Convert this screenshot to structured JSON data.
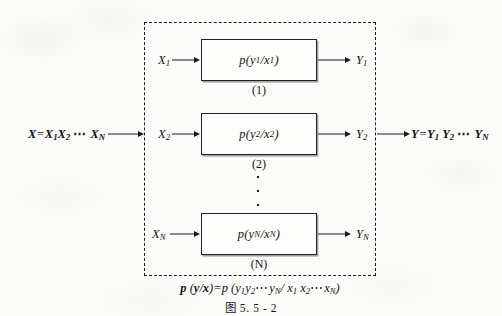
{
  "figure": {
    "caption": "图 5. 5 - 2",
    "aggregate_input": "X=X₁X₂ ⋯ X_N",
    "aggregate_output": "Y=Y₁Y₂ ⋯ Y_N",
    "bottom_formula": "p (y/x)=p (y₁y₂⋯ y_N/ x₁ x₂⋯x_N)",
    "vertical_ellipsis": "⋮",
    "colors": {
      "paper": "#fbfbfa",
      "ink": "#1c1c1c",
      "box_fill": "#fdfdfc",
      "box_border": "#232323",
      "dashed_border": "#1b1b1b"
    },
    "channels": [
      {
        "input_label": "X₁",
        "transition": "p(y₁/x₁)",
        "index": "(1)",
        "output_label": "Y₁"
      },
      {
        "input_label": "X₂",
        "transition": "p(y₂/x₂)",
        "index": "(2)",
        "output_label": "Y₂"
      },
      {
        "input_label": "X_N",
        "transition": "p(y_N/x_N)",
        "index": "(N)",
        "output_label": "Y_N"
      }
    ]
  }
}
